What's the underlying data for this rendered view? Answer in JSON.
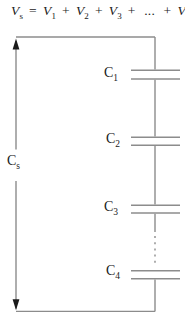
{
  "figure": {
    "title_formula": {
      "lhs": {
        "base": "V",
        "sub": "s"
      },
      "equals": "=",
      "plus": "+",
      "ellipsis": "...",
      "rhs_terms": [
        {
          "base": "V",
          "sub": "1"
        },
        {
          "base": "V",
          "sub": "2"
        },
        {
          "base": "V",
          "sub": "3"
        }
      ],
      "final_term": {
        "base": "V",
        "sub": "n"
      }
    },
    "series_equivalent_label": {
      "base": "C",
      "sub": "s"
    },
    "capacitor_labels": [
      {
        "base": "C",
        "sub": "1"
      },
      {
        "base": "C",
        "sub": "2"
      },
      {
        "base": "C",
        "sub": "3"
      },
      {
        "base": "C",
        "sub": "4"
      }
    ],
    "colors": {
      "wire": "#8c8c8c",
      "arrowhead": "#1b1b1b",
      "text": "#1a1a1a",
      "background": "#ffffff"
    }
  }
}
